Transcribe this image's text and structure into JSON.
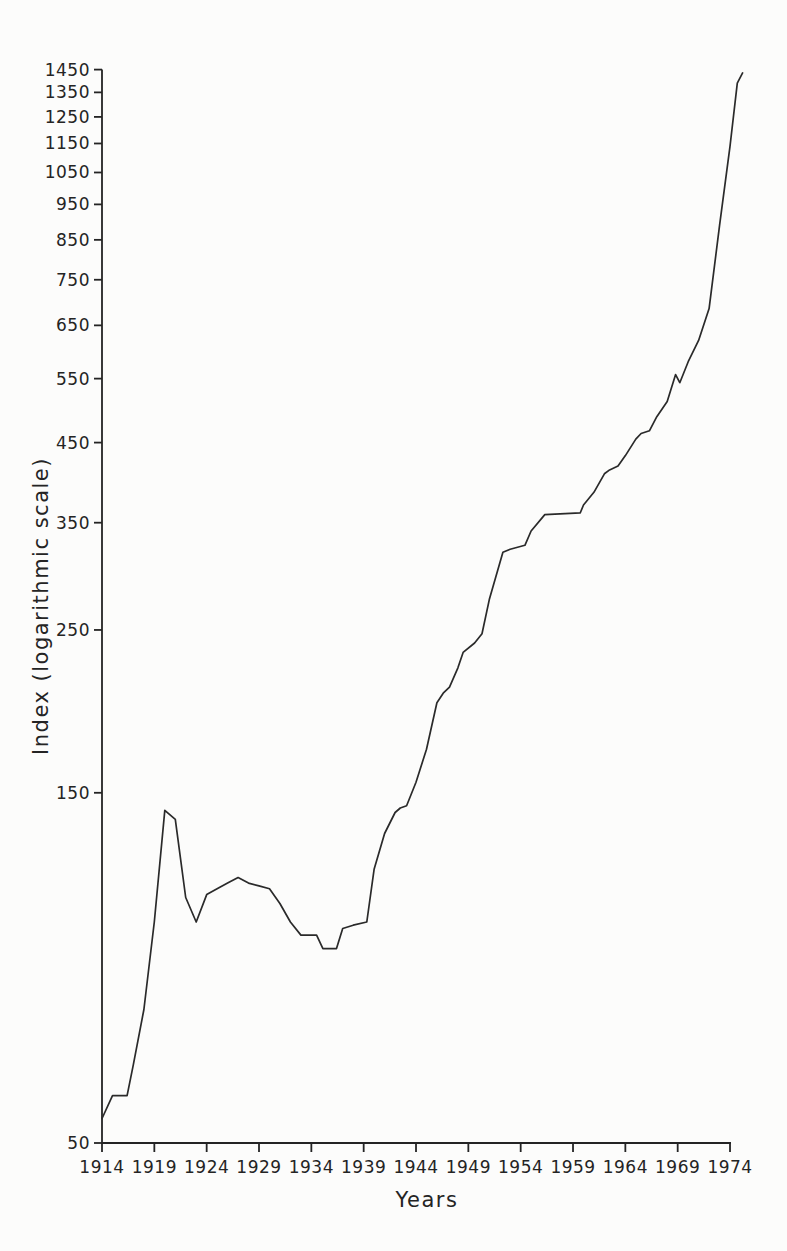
{
  "page": {
    "background": "#fcfcfb",
    "ink": "#242424",
    "line_color": "#2a2a2a"
  },
  "chart_data": {
    "type": "line",
    "title": "",
    "xlabel": "Years",
    "ylabel": "Index (logarithmic scale)",
    "x_scale": "linear",
    "y_scale": "log",
    "grid": false,
    "legend": false,
    "xlim": [
      1914,
      1975.5
    ],
    "ylim": [
      50,
      1450
    ],
    "x_ticks": [
      1914,
      1919,
      1924,
      1929,
      1934,
      1939,
      1944,
      1949,
      1954,
      1959,
      1964,
      1969,
      1974
    ],
    "y_ticks": [
      50,
      150,
      250,
      350,
      450,
      550,
      650,
      750,
      850,
      950,
      1050,
      1150,
      1250,
      1350,
      1450
    ],
    "series": [
      {
        "name": "Index",
        "points": [
          [
            1914,
            54
          ],
          [
            1915,
            58
          ],
          [
            1916.4,
            58
          ],
          [
            1917,
            64
          ],
          [
            1918,
            76
          ],
          [
            1919,
            100
          ],
          [
            1920,
            142
          ],
          [
            1921,
            138
          ],
          [
            1922,
            108
          ],
          [
            1923,
            100
          ],
          [
            1924,
            109
          ],
          [
            1925,
            111
          ],
          [
            1926,
            113
          ],
          [
            1927,
            115
          ],
          [
            1928,
            113
          ],
          [
            1929,
            112
          ],
          [
            1930,
            111
          ],
          [
            1931,
            106
          ],
          [
            1932,
            100
          ],
          [
            1933,
            96
          ],
          [
            1934.5,
            96
          ],
          [
            1935.1,
            92
          ],
          [
            1936.4,
            92
          ],
          [
            1937,
            98
          ],
          [
            1938,
            99
          ],
          [
            1939.3,
            100
          ],
          [
            1940,
            118
          ],
          [
            1941,
            132
          ],
          [
            1942,
            141
          ],
          [
            1942.5,
            143
          ],
          [
            1943.1,
            144
          ],
          [
            1944,
            155
          ],
          [
            1945,
            172
          ],
          [
            1946,
            199
          ],
          [
            1946.6,
            205
          ],
          [
            1947.2,
            209
          ],
          [
            1948,
            222
          ],
          [
            1948.5,
            233
          ],
          [
            1949.6,
            240
          ],
          [
            1950.3,
            247
          ],
          [
            1951,
            275
          ],
          [
            1952.3,
            319
          ],
          [
            1953,
            322
          ],
          [
            1954.4,
            326
          ],
          [
            1955,
            341
          ],
          [
            1956.3,
            359
          ],
          [
            1959.7,
            361
          ],
          [
            1960,
            370
          ],
          [
            1961,
            385
          ],
          [
            1962,
            408
          ],
          [
            1962.5,
            413
          ],
          [
            1963.3,
            418
          ],
          [
            1964,
            432
          ],
          [
            1965,
            455
          ],
          [
            1965.5,
            463
          ],
          [
            1966.3,
            467
          ],
          [
            1967,
            488
          ],
          [
            1968,
            512
          ],
          [
            1968.8,
            557
          ],
          [
            1969.2,
            543
          ],
          [
            1970,
            580
          ],
          [
            1971,
            620
          ],
          [
            1972,
            685
          ],
          [
            1973,
            890
          ],
          [
            1974,
            1140
          ],
          [
            1974.7,
            1390
          ],
          [
            1975.2,
            1435
          ]
        ]
      }
    ]
  }
}
